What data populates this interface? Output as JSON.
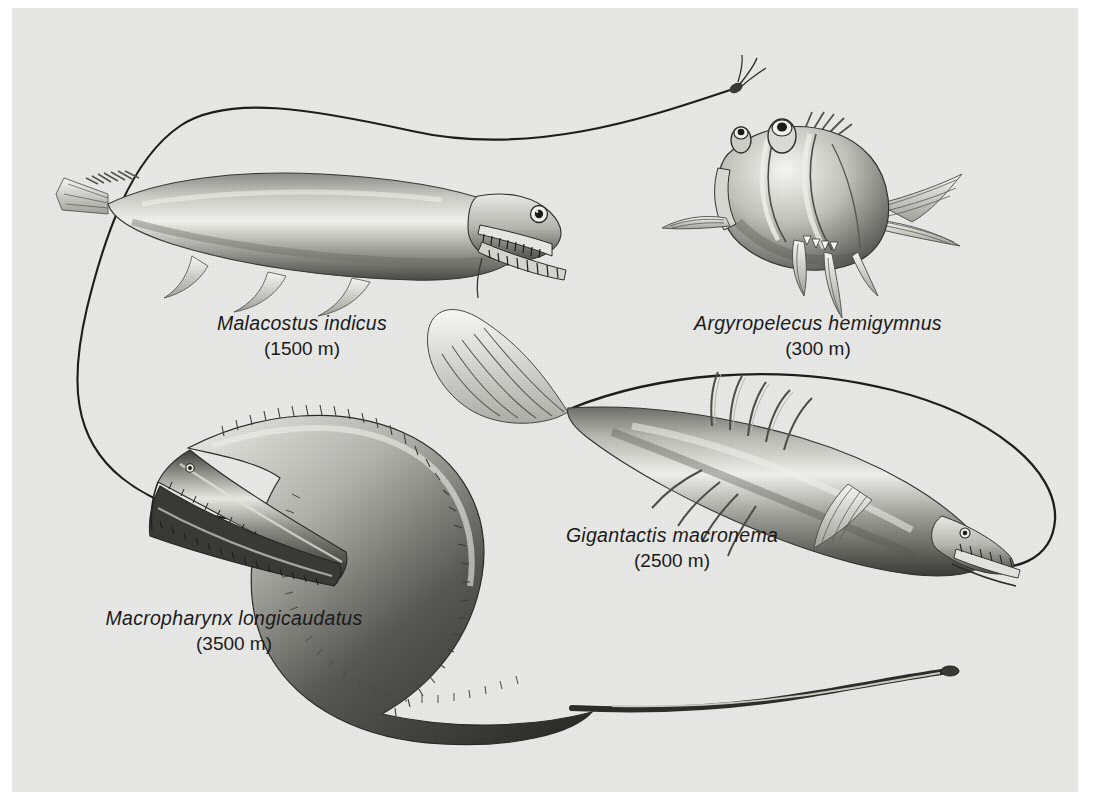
{
  "plate": {
    "background_color": "#ebebe8",
    "page_color": "#ffffff",
    "ink_color": "#1b1b1b",
    "medium": "halftone scraperboard / airbrush illustration",
    "subject": "deep-sea fishes at their depth zones"
  },
  "specimens": [
    {
      "id": "malacostus",
      "name": "Malacostus indicus",
      "depth": "(1500 m)",
      "label_left": 290,
      "label_top": 303,
      "traits": "elongate body, huge gaping jaw with fang teeth, large eye, facing right"
    },
    {
      "id": "argyropelecus",
      "name": "Argyropelecus hemigymnus",
      "depth": "(300 m)",
      "label_left": 805,
      "label_top": 303,
      "traits": "deep hatchet-shaped body, upward tubular eyes, long illicium, facing left"
    },
    {
      "id": "gigantactis",
      "name": "Gigantactis macronema",
      "depth": "(2500 m)",
      "label_left": 660,
      "label_top": 515,
      "traits": "tapering body, fan tail fin, long arching illicium, toothy snout facing right"
    },
    {
      "id": "macropharynx",
      "name": "Macropharynx longicaudatus",
      "depth": "(3500 m)",
      "label_left": 222,
      "label_top": 598,
      "traits": "gulper eel, enormous gaping jaws, minute eye, sinuous body, whip tail"
    }
  ]
}
